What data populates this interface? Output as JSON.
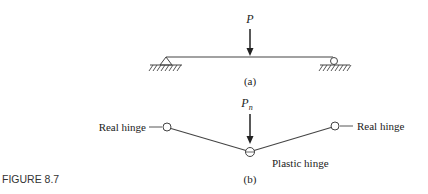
{
  "figure": {
    "label": "FIGURE 8.7"
  },
  "part_a": {
    "load_label": "P",
    "caption": "(a)",
    "left_support": "pin",
    "right_support": "roller"
  },
  "part_b": {
    "load_label_base": "P",
    "load_label_sub": "n",
    "caption": "(b)",
    "left_hinge_label": "Real hinge",
    "right_hinge_label": "Real hinge",
    "middle_hinge_label": "Plastic hinge"
  },
  "colors": {
    "line": "#333333",
    "text": "#222222"
  }
}
